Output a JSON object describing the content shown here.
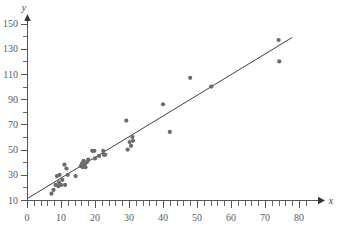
{
  "chart_data": {
    "type": "scatter",
    "title": "",
    "subtitle": "",
    "xlabel": "x",
    "ylabel": "y",
    "xlim": [
      0,
      82
    ],
    "ylim": [
      0,
      158
    ],
    "grid": false,
    "legend": null,
    "x_ticks_major": [
      0,
      10,
      20,
      30,
      40,
      50,
      60,
      70,
      80
    ],
    "x_tick_labels": [
      "0",
      "10",
      "20",
      "30",
      "40",
      "50",
      "60",
      "70",
      "80"
    ],
    "x_minor_step": 2,
    "y_ticks_major": [
      10,
      30,
      50,
      70,
      90,
      110,
      130,
      150
    ],
    "y_tick_labels": [
      "10",
      "30",
      "50",
      "70",
      "90",
      "110",
      "130",
      "150"
    ],
    "y_minor_step": 10,
    "point_color": "#6b6b6b",
    "line_color": "#3f3f3f",
    "points": [
      {
        "x": 7.2,
        "y": 15
      },
      {
        "x": 7.8,
        "y": 18
      },
      {
        "x": 8.4,
        "y": 22
      },
      {
        "x": 8.8,
        "y": 29
      },
      {
        "x": 9.2,
        "y": 21
      },
      {
        "x": 9.4,
        "y": 24
      },
      {
        "x": 9.6,
        "y": 30
      },
      {
        "x": 10.0,
        "y": 22
      },
      {
        "x": 10.4,
        "y": 26
      },
      {
        "x": 11.0,
        "y": 38
      },
      {
        "x": 11.2,
        "y": 22
      },
      {
        "x": 11.6,
        "y": 35
      },
      {
        "x": 12.0,
        "y": 30
      },
      {
        "x": 14.3,
        "y": 29
      },
      {
        "x": 15.8,
        "y": 37
      },
      {
        "x": 16.2,
        "y": 39
      },
      {
        "x": 16.4,
        "y": 36
      },
      {
        "x": 16.6,
        "y": 41
      },
      {
        "x": 17.0,
        "y": 38
      },
      {
        "x": 17.2,
        "y": 36
      },
      {
        "x": 17.6,
        "y": 40
      },
      {
        "x": 18.0,
        "y": 42
      },
      {
        "x": 19.2,
        "y": 49
      },
      {
        "x": 19.8,
        "y": 49
      },
      {
        "x": 20.0,
        "y": 43
      },
      {
        "x": 21.2,
        "y": 45
      },
      {
        "x": 22.4,
        "y": 49
      },
      {
        "x": 22.6,
        "y": 46
      },
      {
        "x": 23.0,
        "y": 46
      },
      {
        "x": 29.2,
        "y": 73
      },
      {
        "x": 29.6,
        "y": 50
      },
      {
        "x": 30.2,
        "y": 56
      },
      {
        "x": 30.6,
        "y": 53
      },
      {
        "x": 31.0,
        "y": 60
      },
      {
        "x": 31.2,
        "y": 57
      },
      {
        "x": 40.0,
        "y": 86
      },
      {
        "x": 42.0,
        "y": 64
      },
      {
        "x": 48.0,
        "y": 107
      },
      {
        "x": 54.2,
        "y": 100
      },
      {
        "x": 74.0,
        "y": 137
      },
      {
        "x": 74.2,
        "y": 120
      }
    ],
    "fit_line": {
      "type": "linear-trend",
      "x_start": 0,
      "y_start": 11,
      "x_end": 78,
      "y_end": 139
    }
  }
}
